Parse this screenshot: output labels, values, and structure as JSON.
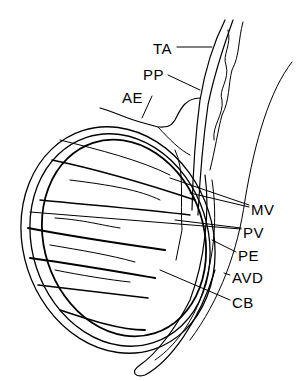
{
  "diagram": {
    "style": "black line art on white",
    "colors": {
      "ink": "#000000",
      "background": "#ffffff"
    },
    "labels": [
      {
        "id": "TA",
        "text": "TA",
        "x": 153,
        "y": 41
      },
      {
        "id": "PP",
        "text": "PP",
        "x": 143,
        "y": 67
      },
      {
        "id": "AE",
        "text": "AE",
        "x": 122,
        "y": 90
      },
      {
        "id": "MV",
        "text": "MV",
        "x": 251,
        "y": 202
      },
      {
        "id": "PV",
        "text": "PV",
        "x": 243,
        "y": 225
      },
      {
        "id": "PE",
        "text": "PE",
        "x": 238,
        "y": 248
      },
      {
        "id": "AVD",
        "text": "AVD",
        "x": 232,
        "y": 270
      },
      {
        "id": "CB",
        "text": "CB",
        "x": 232,
        "y": 295
      }
    ]
  }
}
